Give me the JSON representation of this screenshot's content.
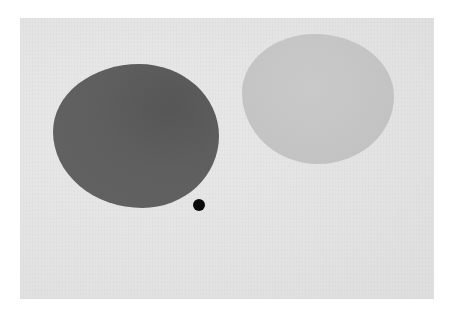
{
  "artwork": {
    "background_color": "#e4e4e4",
    "shapes": [
      {
        "name": "dark-grey-blob",
        "color": "#5f5f5f"
      },
      {
        "name": "light-grey-blob",
        "color": "#c4c4c4"
      },
      {
        "name": "black-dot",
        "color": "#0a0a0a"
      }
    ]
  }
}
